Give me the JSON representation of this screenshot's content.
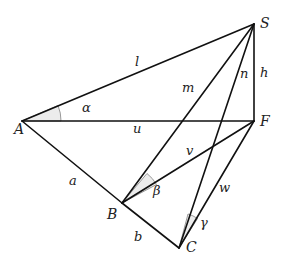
{
  "diagram": {
    "type": "geometry-pyramid",
    "vertices": {
      "A": {
        "label": "A",
        "x": 22,
        "y": 121
      },
      "S": {
        "label": "S",
        "x": 254,
        "y": 24
      },
      "F": {
        "label": "F",
        "x": 254,
        "y": 121
      },
      "B": {
        "label": "B",
        "x": 122,
        "y": 203
      },
      "C": {
        "label": "C",
        "x": 179,
        "y": 248
      }
    },
    "edges": [
      {
        "from": "A",
        "to": "S",
        "label": "l"
      },
      {
        "from": "B",
        "to": "S",
        "label": "m"
      },
      {
        "from": "C",
        "to": "S",
        "label": "n"
      },
      {
        "from": "F",
        "to": "S",
        "label": "h"
      },
      {
        "from": "A",
        "to": "F",
        "label": "u"
      },
      {
        "from": "A",
        "to": "B",
        "label": "a"
      },
      {
        "from": "B",
        "to": "C",
        "label": "b"
      },
      {
        "from": "B",
        "to": "F",
        "label": "v"
      },
      {
        "from": "C",
        "to": "F",
        "label": "w"
      }
    ],
    "angles": [
      {
        "vertex": "A",
        "label": "α",
        "between": [
          "l",
          "u"
        ]
      },
      {
        "vertex": "B",
        "label": "β",
        "between": [
          "m",
          "v"
        ]
      },
      {
        "vertex": "C",
        "label": "γ",
        "between": [
          "n",
          "w"
        ]
      }
    ],
    "labels": {
      "A": "A",
      "S": "S",
      "F": "F",
      "B": "B",
      "C": "C",
      "l": "l",
      "m": "m",
      "n": "n",
      "h": "h",
      "u": "u",
      "a": "a",
      "b": "b",
      "v": "v",
      "w": "w",
      "alpha": "α",
      "beta": "β",
      "gamma": "γ"
    }
  }
}
